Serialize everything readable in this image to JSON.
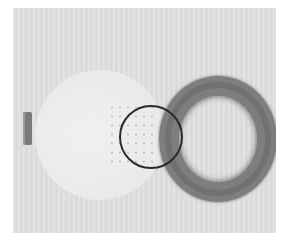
{
  "image": {
    "description": "Grayscale photo of a transparent perforated disc overlapping a dark rubber ring, with a small rectangular tab at left and a black circle highlighting the overlap region",
    "colors": {
      "background": "#e0e0e0",
      "ring": "#7e7e7e",
      "highlight_circle": "#2a2a2a",
      "tab": "#7a7a7a"
    }
  }
}
